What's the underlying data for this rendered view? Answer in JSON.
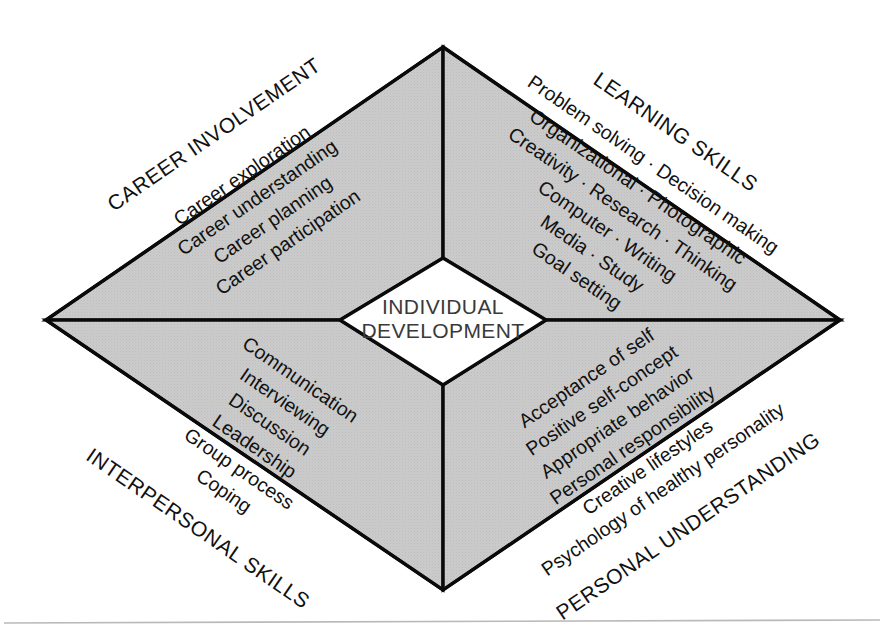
{
  "diagram": {
    "center": {
      "line1": "INDIVIDUAL",
      "line2": "DEVELOPMENT"
    },
    "colors": {
      "quadrant_fill": "#c9c9c9",
      "outline": "#0a0a0a",
      "center_fill": "#ffffff",
      "center_text": "#3a3a3a",
      "item_text": "#111111",
      "baseline_rule": "#b9b9b9"
    },
    "quadrants": [
      {
        "id": "career-involvement",
        "label": "CAREER INVOLVEMENT",
        "position": "top-left",
        "items": [
          "Career exploration",
          "Career understanding",
          "Career planning",
          "Career participation"
        ]
      },
      {
        "id": "learning-skills",
        "label": "LEARNING SKILLS",
        "position": "top-right",
        "items": [
          "Problem solving · Decision making",
          "Organizational · Photographic",
          "Creativity · Research · Thinking",
          "Computer · Writing",
          "Media · Study",
          "Goal setting"
        ]
      },
      {
        "id": "interpersonal-skills",
        "label": "INTERPERSONAL SKILLS",
        "position": "bottom-left",
        "items": [
          "Communication",
          "Interviewing",
          "Discussion",
          "Leadership",
          "Group process",
          "Coping"
        ]
      },
      {
        "id": "personal-understanding",
        "label": "PERSONAL UNDERSTANDING",
        "position": "bottom-right",
        "items": [
          "Acceptance of self",
          "Positive self-concept",
          "Appropriate behavior",
          "Personal responsibility",
          "Creative lifestyles",
          "Psychology of healthy personality"
        ]
      }
    ]
  }
}
